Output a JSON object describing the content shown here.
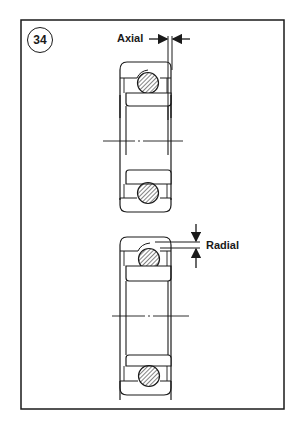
{
  "figure": {
    "number": "34",
    "labels": {
      "axial": "Axial",
      "radial": "Radial"
    },
    "colors": {
      "ink": "#1a1a1a",
      "background": "#ffffff"
    },
    "views": [
      {
        "name": "upper-bearing",
        "measurement": "axial clearance"
      },
      {
        "name": "lower-bearing",
        "measurement": "radial clearance"
      }
    ]
  }
}
